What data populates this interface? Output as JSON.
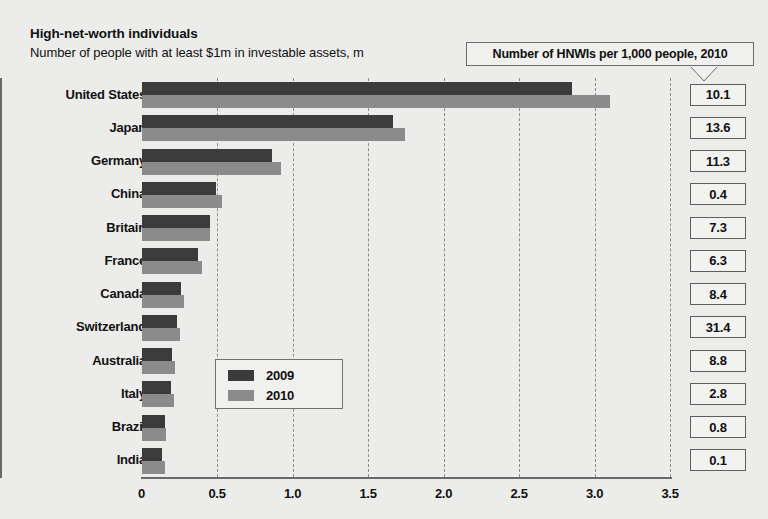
{
  "header": {
    "title": "High-net-worth individuals",
    "subtitle": "Number of people with at least $1m in investable assets, m"
  },
  "callout": {
    "label": "Number of HNWIs per 1,000 people, 2010"
  },
  "legend": {
    "items": [
      {
        "label": "2009",
        "color": "#3b3b3b"
      },
      {
        "label": "2010",
        "color": "#8b8b8b"
      }
    ]
  },
  "axis": {
    "ticks": [
      "0",
      "0.5",
      "1.0",
      "1.5",
      "2.0",
      "2.5",
      "3.0",
      "3.5"
    ],
    "min": 0,
    "max": 3.5
  },
  "chart_data": {
    "type": "bar",
    "title": "High-net-worth individuals",
    "subtitle": "Number of people with at least $1m in investable assets, m",
    "orientation": "horizontal",
    "xlabel": "",
    "ylabel": "",
    "xlim": [
      0,
      3.5
    ],
    "grid": true,
    "legend_position": "inside-center",
    "categories": [
      "United States",
      "Japan",
      "Germany",
      "China",
      "Britain",
      "France",
      "Canada",
      "Switzerland",
      "Australia",
      "Italy",
      "Brazil",
      "India"
    ],
    "series": [
      {
        "name": "2009",
        "color": "#3b3b3b",
        "values": [
          2.85,
          1.66,
          0.86,
          0.49,
          0.45,
          0.37,
          0.26,
          0.23,
          0.2,
          0.19,
          0.15,
          0.13
        ]
      },
      {
        "name": "2010",
        "color": "#8b8b8b",
        "values": [
          3.1,
          1.74,
          0.92,
          0.53,
          0.45,
          0.4,
          0.28,
          0.25,
          0.22,
          0.21,
          0.16,
          0.15
        ]
      }
    ],
    "annotation_column": {
      "header": "Number of HNWIs per 1,000 people, 2010",
      "values": [
        "10.1",
        "13.6",
        "11.3",
        "0.4",
        "7.3",
        "6.3",
        "8.4",
        "31.4",
        "8.8",
        "2.8",
        "0.8",
        "0.1"
      ]
    }
  }
}
